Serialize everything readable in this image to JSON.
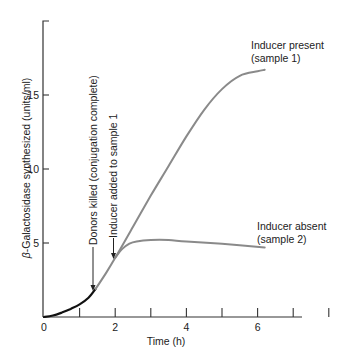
{
  "chart_data": {
    "type": "line",
    "title": "",
    "xlabel": "Time (h)",
    "ylabel": "β-Galactosidase synthesized (units/ml)",
    "ylabel_prefix": "β",
    "ylabel_rest": "-Galactosidase synthesized (units/ml)",
    "xlim": [
      0,
      8
    ],
    "ylim": [
      0,
      19
    ],
    "x_ticks": [
      0,
      1,
      2,
      3,
      4,
      5,
      6,
      7,
      8
    ],
    "x_tick_labels": [
      {
        "v": 0,
        "t": "0"
      },
      {
        "v": 2,
        "t": "2"
      },
      {
        "v": 4,
        "t": "4"
      },
      {
        "v": 6,
        "t": "6"
      }
    ],
    "y_ticks": [
      5,
      10,
      15
    ],
    "y_tick_labels": [
      {
        "v": 5,
        "t": "5"
      },
      {
        "v": 10,
        "t": "10"
      },
      {
        "v": 15,
        "t": "15"
      }
    ],
    "grid": false,
    "series": [
      {
        "name": "Before donors killed",
        "color": "#111111",
        "x": [
          0,
          0.25,
          0.5,
          0.75,
          1.0,
          1.25,
          1.45
        ],
        "values": [
          0,
          0.1,
          0.3,
          0.55,
          0.85,
          1.3,
          1.9
        ]
      },
      {
        "name": "Inducer present (sample 1)",
        "color": "#8a8a8a",
        "x": [
          1.45,
          1.75,
          2.0,
          2.5,
          3.0,
          3.5,
          4.0,
          4.5,
          5.0,
          5.5,
          6.0,
          6.2
        ],
        "values": [
          1.9,
          3.0,
          4.0,
          6.1,
          8.2,
          10.2,
          12.2,
          14.0,
          15.4,
          16.3,
          16.6,
          16.7
        ]
      },
      {
        "name": "Inducer absent (sample 2)",
        "color": "#8a8a8a",
        "x": [
          2.0,
          2.2,
          2.4,
          2.6,
          3.0,
          3.5,
          4.0,
          5.0,
          6.2
        ],
        "values": [
          4.0,
          4.6,
          4.95,
          5.1,
          5.2,
          5.2,
          5.1,
          4.95,
          4.7
        ]
      }
    ],
    "legend": {
      "position": "inline",
      "entries": [
        "Inducer present (sample 1)",
        "Inducer absent (sample 2)"
      ]
    },
    "annotations": [
      {
        "text": "Donors killed (conjugation complete)",
        "x": 1.45,
        "arrow_to_y": 1.9
      },
      {
        "text": "Inducer added to sample 1",
        "x": 2.0,
        "arrow_to_y": 4.0
      }
    ],
    "series_labels": {
      "s1_line1": "Inducer present",
      "s1_line2": "(sample 1)",
      "s2_line1": "Inducer absent",
      "s2_line2": "(sample 2)"
    }
  }
}
